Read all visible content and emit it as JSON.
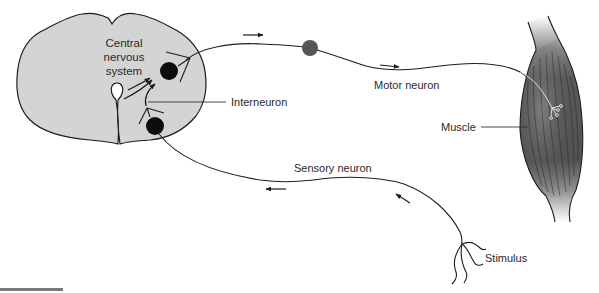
{
  "diagram": {
    "labels": {
      "cns_line1": "Central",
      "cns_line2": "nervous",
      "cns_line3": "system",
      "interneuron": "Interneuron",
      "motor_neuron": "Motor neuron",
      "muscle": "Muscle",
      "sensory_neuron": "Sensory neuron",
      "stimulus": "Stimulus"
    },
    "colors": {
      "cns_fill": "#d4d4d4",
      "outline": "#1e1e1e",
      "cell_body": "#0d0d0d",
      "ganglion": "#555555",
      "muscle_dark": "#4a4a4a",
      "muscle_light": "#8a8a8a",
      "divider": "#7a7a7a"
    }
  }
}
